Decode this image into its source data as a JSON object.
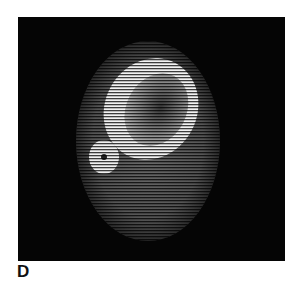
{
  "figure": {
    "panel_label": "D",
    "image": {
      "type": "CT cross-section scan",
      "description": "Axial scan showing soft tissue outline with a large bone ring and a smaller bone with central dark spot",
      "colors": {
        "background": "#050505",
        "bone": "#f2f2f2",
        "soft_tissue": "#5a5a5a",
        "page": "#ffffff"
      }
    }
  }
}
